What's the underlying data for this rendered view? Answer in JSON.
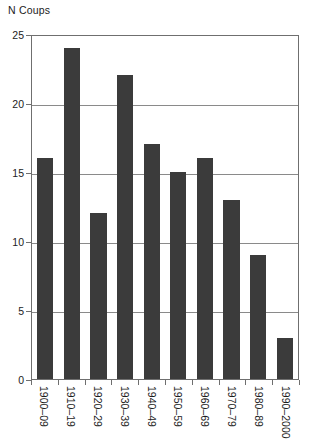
{
  "chart_data": {
    "type": "bar",
    "title": "N Coups",
    "xlabel": "",
    "ylabel": "N Coups",
    "categories": [
      "1900–09",
      "1910–19",
      "1920–29",
      "1930–39",
      "1940–49",
      "1950–59",
      "1960–69",
      "1970–79",
      "1980–89",
      "1990–2000"
    ],
    "values": [
      16,
      24,
      12,
      22,
      17,
      15,
      16,
      13,
      9,
      3
    ],
    "ylim": [
      0,
      25
    ],
    "yticks": [
      0,
      5,
      10,
      15,
      20,
      25
    ],
    "ytick_labels": [
      "0",
      "5",
      "10",
      "15",
      "20",
      "25"
    ],
    "grid": true,
    "grid_axis": "y",
    "legend": false,
    "bar_color": "#3b3b3b",
    "grid_color": "#8a8a8a",
    "axis_color": "#6f6f6f",
    "background": "#ffffff",
    "xtick_label_rotation": 90
  }
}
